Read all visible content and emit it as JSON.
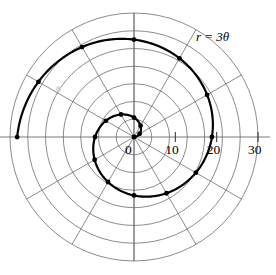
{
  "figure": {
    "equation_label": "r = 3θ",
    "background_color": "#ffffff",
    "curve_color": "#000000",
    "grid_color": "#5a5a5a",
    "axis_color": "#6b6b6b"
  },
  "chart_data": {
    "type": "line",
    "subtype": "polar",
    "title": "",
    "annotation": "r = 3θ",
    "equation": "r = 3*theta",
    "xlabel": "",
    "ylabel": "",
    "rlim": [
      0,
      30
    ],
    "r_tick_labels": [
      "0",
      "10",
      "20",
      "30"
    ],
    "r_tick_values": [
      0,
      10,
      20,
      30
    ],
    "r_ring_values": [
      4.3,
      8.6,
      12.9,
      17.1,
      21.4,
      25.7,
      30
    ],
    "theta_spokes_deg": [
      0,
      30,
      60,
      90,
      120,
      150,
      180,
      210,
      240,
      270,
      300,
      330
    ],
    "grid": true,
    "legend": "none",
    "marker_theta_deg": [
      0,
      30,
      60,
      90,
      120,
      150,
      180,
      210,
      240,
      270,
      300,
      330,
      360
    ],
    "marker_points_polar": [
      {
        "theta_deg": 0,
        "theta_rad": 0.0,
        "r": 0.0
      },
      {
        "theta_deg": 30,
        "theta_rad": 0.524,
        "r": 1.57
      },
      {
        "theta_deg": 60,
        "theta_rad": 1.047,
        "r": 3.14
      },
      {
        "theta_deg": 90,
        "theta_rad": 1.571,
        "r": 4.71
      },
      {
        "theta_deg": 120,
        "theta_rad": 2.094,
        "r": 6.28
      },
      {
        "theta_deg": 150,
        "theta_rad": 2.618,
        "r": 7.85
      },
      {
        "theta_deg": 180,
        "theta_rad": 3.142,
        "r": 9.42
      },
      {
        "theta_deg": 210,
        "theta_rad": 3.665,
        "r": 11.0
      },
      {
        "theta_deg": 240,
        "theta_rad": 4.189,
        "r": 12.57
      },
      {
        "theta_deg": 270,
        "theta_rad": 4.712,
        "r": 14.14
      },
      {
        "theta_deg": 300,
        "theta_rad": 5.236,
        "r": 15.71
      },
      {
        "theta_deg": 330,
        "theta_rad": 5.76,
        "r": 17.28
      },
      {
        "theta_deg": 360,
        "theta_rad": 6.283,
        "r": 18.85
      },
      {
        "theta_deg": 390,
        "theta_rad": 6.807,
        "r": 20.42
      },
      {
        "theta_deg": 420,
        "theta_rad": 7.33,
        "r": 21.99
      },
      {
        "theta_deg": 450,
        "theta_rad": 7.854,
        "r": 23.56
      },
      {
        "theta_deg": 480,
        "theta_rad": 8.378,
        "r": 25.13
      },
      {
        "theta_deg": 510,
        "theta_rad": 8.901,
        "r": 26.7
      },
      {
        "theta_deg": 540,
        "theta_rad": 9.425,
        "r": 28.27
      }
    ],
    "theta_range_rad": [
      0,
      9.425
    ],
    "theta_range_deg": [
      0,
      540
    ],
    "turns": 1.5
  },
  "geometry": {
    "center_x": 134,
    "center_y": 137,
    "outer_radius_px": 124,
    "px_per_unit": 4.133,
    "n_rings": 7,
    "n_spokes": 12
  }
}
